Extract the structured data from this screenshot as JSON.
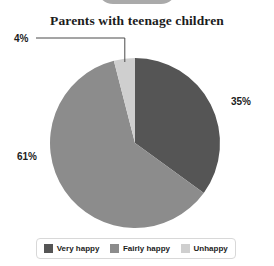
{
  "chart_data": {
    "type": "pie",
    "title": "Parents with teenage children",
    "categories": [
      "Very happy",
      "Fairly happy",
      "Unhappy"
    ],
    "values": [
      35,
      61,
      4
    ],
    "value_labels": [
      "35%",
      "61%",
      "4%"
    ],
    "colors": [
      "#555555",
      "#8c8c8c",
      "#cfcfcf"
    ],
    "units": "percent",
    "start_angle_deg": 0,
    "direction": "clockwise",
    "legend_position": "bottom",
    "grid": false,
    "xlabel": "",
    "ylabel": "",
    "annotations": [
      {
        "text": "4%",
        "leader_line": true,
        "points_to": "Unhappy"
      }
    ]
  },
  "legend": {
    "items": [
      {
        "label": "Very happy",
        "color": "#555555"
      },
      {
        "label": "Fairly happy",
        "color": "#8c8c8c"
      },
      {
        "label": "Unhappy",
        "color": "#cfcfcf"
      }
    ]
  }
}
